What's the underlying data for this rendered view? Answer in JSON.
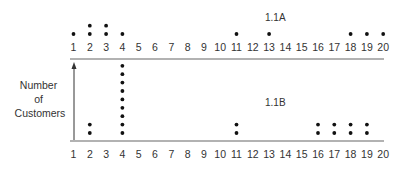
{
  "chart_data": [
    {
      "type": "scatter",
      "subtype": "dot-plot",
      "title": "1.1A",
      "xlabel": "",
      "ylabel": "Number of Customers",
      "categories": [
        1,
        2,
        3,
        4,
        5,
        6,
        7,
        8,
        9,
        10,
        11,
        12,
        13,
        14,
        15,
        16,
        17,
        18,
        19,
        20
      ],
      "values": [
        1,
        2,
        2,
        1,
        0,
        0,
        0,
        0,
        0,
        0,
        1,
        0,
        1,
        0,
        0,
        0,
        0,
        1,
        1,
        1
      ],
      "grid": false,
      "axis_position": "below_labels"
    },
    {
      "type": "scatter",
      "subtype": "dot-plot",
      "title": "1.1B",
      "xlabel": "",
      "ylabel": "Number of Customers",
      "categories": [
        1,
        2,
        3,
        4,
        5,
        6,
        7,
        8,
        9,
        10,
        11,
        12,
        13,
        14,
        15,
        16,
        17,
        18,
        19,
        20
      ],
      "values": [
        0,
        2,
        0,
        9,
        0,
        0,
        0,
        0,
        0,
        0,
        2,
        0,
        0,
        0,
        0,
        2,
        2,
        2,
        2,
        0
      ],
      "grid": false
    }
  ],
  "ylabel_lines": [
    "Number",
    "of",
    "Customers"
  ],
  "chartA": {
    "title": "1.1A"
  },
  "chartB": {
    "title": "1.1B"
  },
  "ticks": [
    "1",
    "2",
    "3",
    "4",
    "5",
    "6",
    "7",
    "8",
    "9",
    "10",
    "11",
    "12",
    "13",
    "14",
    "15",
    "16",
    "17",
    "18",
    "19",
    "20"
  ]
}
